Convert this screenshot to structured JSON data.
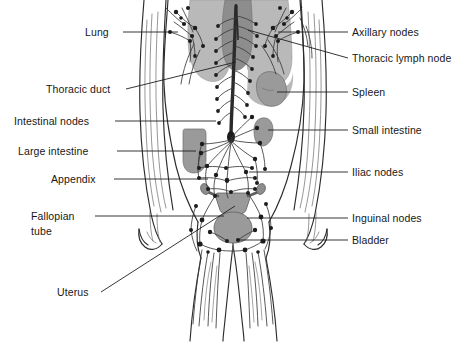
{
  "diagram": {
    "type": "anatomical-illustration",
    "palette": {
      "background": "#ffffff",
      "outline": "#2b2b2b",
      "vessel": "#3a3a3a",
      "node_fill": "#1d1d1d",
      "lung_fill": "#b9b9b9",
      "heart_fill": "#8d8d8d",
      "organ_fill": "#9a9a9a",
      "duct_fill": "#2a2a2a",
      "label_text": "#171717",
      "leader_line": "#1f1f1f"
    }
  },
  "labels_left": [
    {
      "id": "lung",
      "text": "Lung",
      "x": 85,
      "y": 26,
      "line_to_x": 178,
      "line_from_x": 123,
      "line_y": 32
    },
    {
      "id": "thoracic-duct",
      "text": "Thoracic duct",
      "x": 46,
      "y": 83,
      "line_to_x": 232,
      "line_from_x": 126,
      "line_y": 89
    },
    {
      "id": "intestinal-nodes",
      "text": "Intestinal nodes",
      "x": 14,
      "y": 115,
      "line_to_x": 216,
      "line_from_x": 115,
      "line_y": 121
    },
    {
      "id": "large-intestine",
      "text": "Large intestine",
      "x": 18,
      "y": 145,
      "line_to_x": 196,
      "line_from_x": 117,
      "line_y": 151
    },
    {
      "id": "appendix",
      "text": "Appendix",
      "x": 51,
      "y": 173,
      "line_to_x": 208,
      "line_from_x": 114,
      "line_y": 179
    },
    {
      "id": "fallopian-tube",
      "text": "Fallopian",
      "x": 31,
      "y": 210,
      "line_to_x": 224,
      "line_from_x": 95,
      "line_y": 216
    },
    {
      "id": "fallopian-tube-2",
      "text": "tube",
      "x": 31,
      "y": 225,
      "line_to_x": null,
      "line_from_x": null,
      "line_y": null
    },
    {
      "id": "uterus",
      "text": "Uterus",
      "x": 57,
      "y": 286,
      "line_to_x": 228,
      "line_from_x": 101,
      "line_y": 292
    }
  ],
  "labels_right": [
    {
      "id": "axillary-nodes",
      "text": "Axillary nodes",
      "x": 352,
      "y": 26,
      "line_from_x": 330,
      "line_to_x": 248,
      "line_y": 32
    },
    {
      "id": "thoracic-lymph-node",
      "text": "Thoracic lymph node",
      "x": 352,
      "y": 52,
      "line_from_x": 330,
      "line_to_x": 237,
      "line_y": 58
    },
    {
      "id": "spleen",
      "text": "Spleen",
      "x": 352,
      "y": 86,
      "line_from_x": 345,
      "line_to_x": 272,
      "line_y": 92
    },
    {
      "id": "small-intestine",
      "text": "Small intestine",
      "x": 352,
      "y": 124,
      "line_from_x": 345,
      "line_to_x": 264,
      "line_y": 130
    },
    {
      "id": "iliac-nodes",
      "text": "Iliac nodes",
      "x": 352,
      "y": 166,
      "line_from_x": 345,
      "line_to_x": 248,
      "line_y": 172
    },
    {
      "id": "inguinal-nodes",
      "text": "Inguinal nodes",
      "x": 352,
      "y": 212,
      "line_from_x": 345,
      "line_to_x": 247,
      "line_y": 218
    },
    {
      "id": "bladder",
      "text": "Bladder",
      "x": 352,
      "y": 234,
      "line_from_x": 345,
      "line_to_x": 238,
      "line_y": 240
    }
  ],
  "organs": [
    {
      "id": "lung-left",
      "name": "Lung (left)",
      "fill": "#b9b9b9"
    },
    {
      "id": "lung-right",
      "name": "Lung (right)",
      "fill": "#b9b9b9"
    },
    {
      "id": "heart",
      "name": "Heart / mediastinum",
      "fill": "#8d8d8d"
    },
    {
      "id": "spleen-organ",
      "name": "Spleen",
      "fill": "#9a9a9a"
    },
    {
      "id": "small-intestine-organ",
      "name": "Small intestine",
      "fill": "#9a9a9a"
    },
    {
      "id": "large-intestine-organ",
      "name": "Large intestine",
      "fill": "#9a9a9a"
    },
    {
      "id": "uterus-organ",
      "name": "Uterus",
      "fill": "#9a9a9a"
    },
    {
      "id": "bladder-organ",
      "name": "Bladder",
      "fill": "#9a9a9a"
    },
    {
      "id": "thoracic-duct-organ",
      "name": "Thoracic duct",
      "fill": "#2a2a2a"
    }
  ]
}
